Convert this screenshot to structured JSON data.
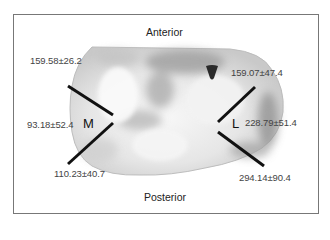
{
  "figure": {
    "orientation": {
      "top": "Anterior",
      "bottom": "Posterior"
    },
    "regions": {
      "medial": "M",
      "lateral": "L"
    },
    "measurements": {
      "medial_anterior": "159.58±26.2",
      "medial_middle": "93.18±52.4",
      "medial_posterior": "110.23±40.7",
      "lateral_anterior": "159.07±47.4",
      "lateral_middle": "228.79±51.4",
      "lateral_posterior": "294.14±90.4"
    },
    "colors": {
      "frame": "#777777",
      "lines": "#111111",
      "tissue_light": "#f2f2f2",
      "tissue_dark": "#8a8a8a"
    }
  }
}
